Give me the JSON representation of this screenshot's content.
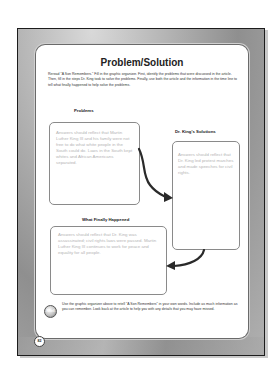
{
  "page": {
    "title": "Problem/Solution",
    "instructions": "Reread \"A Son Remembers.\" Fill in the graphic organizer. First, identify the problems that were discussed in the article. Then, fill in the steps Dr. King took to solve the problems. Finally, use both the article and the information in the time line to tell what finally happened to help solve the problems.",
    "page_number": "82"
  },
  "organizer": {
    "problems": {
      "label": "Problems",
      "answer": "Answers should reflect that Martin Luther King III and his family were not free to do what white people in the South could do. Laws in the South kept whites and African Americans separated."
    },
    "solutions": {
      "label": "Dr. King's Solutions",
      "answer": "Answers should reflect that Dr. King led protest marches and made speeches for civil rights."
    },
    "outcome": {
      "label": "What Finally Happened",
      "answer": "Answers should reflect that Dr. King was assassinated; civil rights laws were passed. Martin Luther King III continues to work for peace and equality for all people."
    }
  },
  "footer": {
    "icon_label": "Retell",
    "text": "Use the graphic organizer above to retell \"A Son Remembers\" in your own words. Include as much information as you can remember. Look back at the article to help you with any details that you may have missed."
  },
  "colors": {
    "frame_gray": "#9c9c9c",
    "answer_text": "#b5b5b5",
    "arrow": "#2a2a2a"
  }
}
